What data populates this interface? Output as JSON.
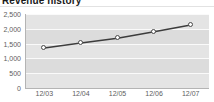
{
  "widget": {
    "title": "Revenue history"
  },
  "colors": {
    "plot_background": "#e4e4e4",
    "gridline": "#fafafa",
    "band": "#dcdcdc",
    "axis": "#b4b4b4",
    "line": "#3c3c3c",
    "marker_fill": "#ffffff",
    "marker_stroke": "#4a4a4a",
    "tick_text": "#5d5d5d",
    "title_text": "#1a1a1a"
  },
  "chart_data": {
    "type": "line",
    "title": "Revenue history",
    "xlabel": "",
    "ylabel": "",
    "categories": [
      "12/03",
      "12/04",
      "12/05",
      "12/06",
      "12/07"
    ],
    "values": [
      1350,
      1520,
      1680,
      1900,
      2130
    ],
    "series": [
      {
        "name": "Revenue",
        "values": [
          1350,
          1520,
          1680,
          1900,
          2130
        ]
      }
    ],
    "ylim": [
      0,
      2500
    ],
    "yticks": [
      0,
      500,
      1000,
      1500,
      2000,
      2500
    ],
    "ytick_labels": [
      "0",
      "500",
      "1,000",
      "1,500",
      "2,000",
      "2,500"
    ],
    "xtick_labels": [
      "12/03",
      "12/04",
      "12/05",
      "12/06",
      "12/07"
    ],
    "grid": true,
    "legend": false,
    "markers": "circle"
  }
}
